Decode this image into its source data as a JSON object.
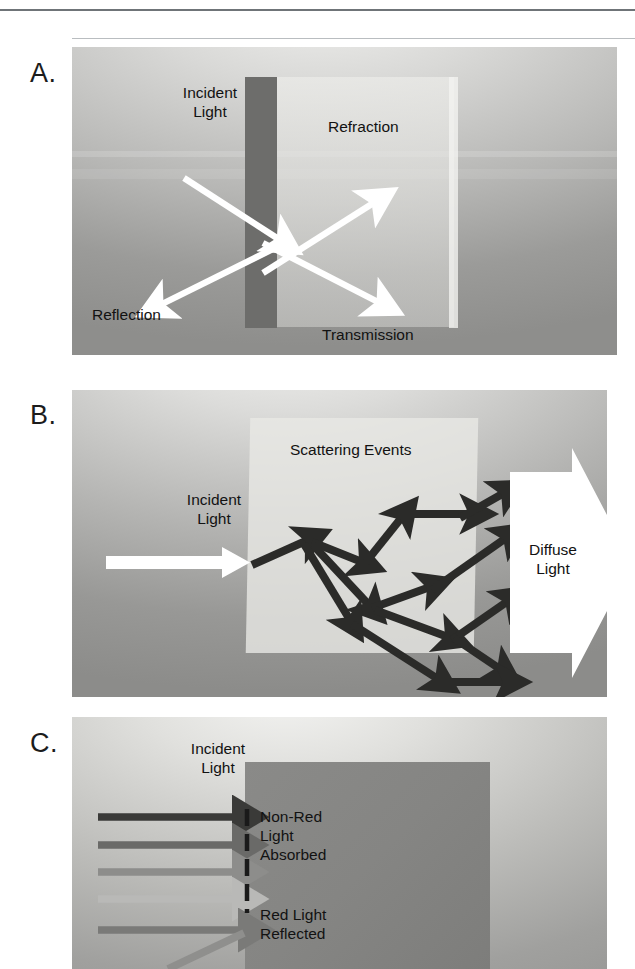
{
  "figure": {
    "panels": [
      {
        "letter": "A.",
        "name": "specular-panel",
        "labels": [
          {
            "id": "incident",
            "text": "Incident\nLight"
          },
          {
            "id": "refraction",
            "text": "Refraction"
          },
          {
            "id": "reflection",
            "text": "Reflection"
          },
          {
            "id": "transmission",
            "text": "Transmission"
          }
        ],
        "arrows": [
          {
            "id": "incident-ray",
            "kind": "white-solid",
            "from": [
              112,
              131
            ],
            "to": [
              213,
              196
            ]
          },
          {
            "id": "reflection-ray",
            "kind": "white-solid",
            "from": [
              213,
              196
            ],
            "to": [
              83,
              262
            ]
          },
          {
            "id": "refraction-ray",
            "kind": "white-solid",
            "from": [
              191,
              226
            ],
            "to": [
              308,
              152
            ]
          },
          {
            "id": "transmission-ray",
            "kind": "white-solid",
            "from": [
              191,
              196
            ],
            "to": [
              313,
              259
            ]
          }
        ]
      },
      {
        "letter": "B.",
        "name": "scattering-panel",
        "labels": [
          {
            "id": "scattering-events",
            "text": "Scattering Events"
          },
          {
            "id": "incident",
            "text": "Incident\nLight"
          },
          {
            "id": "diffuse",
            "text": "Diffuse\nLight"
          }
        ],
        "arrows": [
          {
            "id": "incident-beam",
            "kind": "white-block"
          },
          {
            "id": "scatter-path-1",
            "kind": "dark-zigzag"
          },
          {
            "id": "scatter-path-2",
            "kind": "dark-zigzag"
          },
          {
            "id": "scatter-path-3",
            "kind": "dark-zigzag"
          },
          {
            "id": "diffuse-arrow",
            "kind": "white-block-arrow"
          }
        ]
      },
      {
        "letter": "C.",
        "name": "absorption-panel",
        "labels": [
          {
            "id": "incident",
            "text": "Incident\nLight"
          },
          {
            "id": "absorbed",
            "text": "Non-Red\nLight\nAbsorbed"
          },
          {
            "id": "reflected",
            "text": "Red Light\nReflected"
          }
        ],
        "rays": [
          {
            "id": "ray-1",
            "shade": "#3a3a38",
            "blocked": true
          },
          {
            "id": "ray-2",
            "shade": "#6a6a68",
            "blocked": true
          },
          {
            "id": "ray-3",
            "shade": "#8d8d8b",
            "blocked": true
          },
          {
            "id": "ray-4",
            "shade": "#b9b9b7",
            "blocked": true
          },
          {
            "id": "ray-5",
            "shade": "#7a7a78",
            "blocked": false
          }
        ],
        "reflected_ray": {
          "id": "red-reflected-ray",
          "shade": "#8f8f8d"
        },
        "barrier": {
          "id": "absorption-barrier",
          "style": "dashed",
          "color": "#1a1a1a"
        }
      }
    ]
  },
  "colors": {
    "ink": "#121212",
    "white_arrow": "#ffffff",
    "dark_arrow": "#2b2b29",
    "panel_dark": "#8c8c8a",
    "panel_light": "#f2f2f0",
    "slab_dark": "#6d6d6b",
    "absorber": "#858583"
  }
}
